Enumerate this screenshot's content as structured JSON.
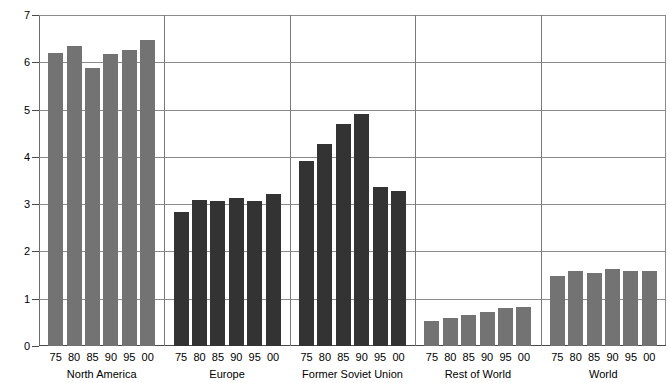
{
  "chart_data": {
    "type": "bar",
    "title": "",
    "xlabel": "",
    "ylabel": "Tons oil equivalent",
    "ylim": [
      0,
      7
    ],
    "yticks": [
      0,
      1,
      2,
      3,
      4,
      5,
      6,
      7
    ],
    "ytick_labels": [
      "0",
      "1",
      "2",
      "3",
      "4",
      "5",
      "6",
      "7"
    ],
    "grid": true,
    "legend": "none",
    "categories": [
      "75",
      "80",
      "85",
      "90",
      "95",
      "00"
    ],
    "groups": [
      {
        "name": "North America",
        "color": "#737373",
        "categories": [
          "75",
          "80",
          "85",
          "90",
          "95",
          "00"
        ],
        "values": [
          6.2,
          6.35,
          5.88,
          6.17,
          6.27,
          6.48
        ]
      },
      {
        "name": "Europe",
        "color": "#333333",
        "categories": [
          "75",
          "80",
          "85",
          "90",
          "95",
          "00"
        ],
        "values": [
          2.84,
          3.09,
          3.07,
          3.14,
          3.06,
          3.21
        ]
      },
      {
        "name": "Former Soviet Union",
        "color": "#333333",
        "categories": [
          "75",
          "80",
          "85",
          "90",
          "95",
          "00"
        ],
        "values": [
          3.92,
          4.27,
          4.7,
          4.9,
          3.37,
          3.27
        ]
      },
      {
        "name": "Rest of World",
        "color": "#737373",
        "categories": [
          "75",
          "80",
          "85",
          "90",
          "95",
          "00"
        ],
        "values": [
          0.53,
          0.6,
          0.65,
          0.72,
          0.8,
          0.82
        ]
      },
      {
        "name": "World",
        "color": "#737373",
        "categories": [
          "75",
          "80",
          "85",
          "90",
          "95",
          "00"
        ],
        "values": [
          1.49,
          1.58,
          1.55,
          1.62,
          1.58,
          1.59
        ]
      }
    ]
  }
}
